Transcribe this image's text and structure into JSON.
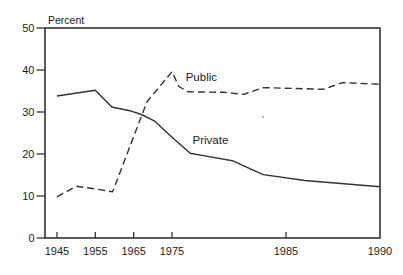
{
  "figure": {
    "background": "#ffffff",
    "ink_color": "#333333",
    "text_color": "#1c1c1c",
    "artifact_dot": {
      "x": 263,
      "y": 117
    }
  },
  "chart_data": {
    "type": "line",
    "title": "",
    "y_axis_label": "Percent",
    "xlabel": "",
    "ylabel": "Percent",
    "ylim": [
      0,
      50
    ],
    "y_ticks": [
      50,
      40,
      30,
      20,
      10,
      0
    ],
    "x_ticks": [
      {
        "label": "1945",
        "year": 1945,
        "mark": true
      },
      {
        "label": "1955",
        "year": 1955,
        "mark": true
      },
      {
        "label": "1965",
        "year": 1965,
        "mark": true
      },
      {
        "label": "1975",
        "year": 1975,
        "mark": true
      },
      {
        "label": "1985",
        "year": 1985,
        "mark": true
      },
      {
        "label": "1990",
        "year": 1990,
        "mark": false
      }
    ],
    "grid": false,
    "frame": "full-box",
    "legend_position": "inline-labels",
    "x_axis_anchors": [
      {
        "year": 1945,
        "px": 57
      },
      {
        "year": 1975,
        "px": 172
      },
      {
        "year": 1985,
        "px": 286
      },
      {
        "year": 1990,
        "px": 380
      }
    ],
    "series": [
      {
        "name": "Public",
        "line_style": "dashed",
        "label_anchor": {
          "year": 1976.2,
          "value": 38.4
        },
        "points": [
          [
            1945,
            9.8
          ],
          [
            1950,
            12.3
          ],
          [
            1955,
            11.7
          ],
          [
            1959.5,
            11.0
          ],
          [
            1968.5,
            32.5
          ],
          [
            1975,
            39.6
          ],
          [
            1975.6,
            36.1
          ],
          [
            1976.4,
            34.8
          ],
          [
            1979.5,
            34.7
          ],
          [
            1981.3,
            34.2
          ],
          [
            1983,
            35.8
          ],
          [
            1987,
            35.4
          ],
          [
            1988,
            37.0
          ],
          [
            1990,
            36.6
          ]
        ]
      },
      {
        "name": "Private",
        "line_style": "solid",
        "label_anchor": {
          "year": 1976.8,
          "value": 23.4
        },
        "points": [
          [
            1945,
            33.8
          ],
          [
            1955,
            35.2
          ],
          [
            1959.3,
            31.2
          ],
          [
            1964,
            30.3
          ],
          [
            1967,
            29.4
          ],
          [
            1970.5,
            27.8
          ],
          [
            1975,
            24.0
          ],
          [
            1976.6,
            20.2
          ],
          [
            1978,
            19.5
          ],
          [
            1980.3,
            18.4
          ],
          [
            1981.3,
            17.2
          ],
          [
            1983,
            15.1
          ],
          [
            1986,
            13.7
          ],
          [
            1990,
            12.2
          ]
        ]
      }
    ]
  }
}
